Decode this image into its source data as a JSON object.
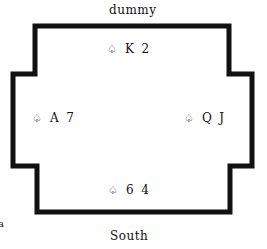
{
  "labels": {
    "north": "dummy",
    "south": "South",
    "fragment": "a"
  },
  "hands": {
    "north": {
      "suit": "♤",
      "cards": "K  2"
    },
    "west": {
      "suit": "♤",
      "cards": "A  7"
    },
    "east": {
      "suit": "♤",
      "cards": "Q  J"
    },
    "south": {
      "suit": "♤",
      "cards": "6  4"
    }
  },
  "colors": {
    "line": "#111111",
    "background": "#ffffff"
  }
}
